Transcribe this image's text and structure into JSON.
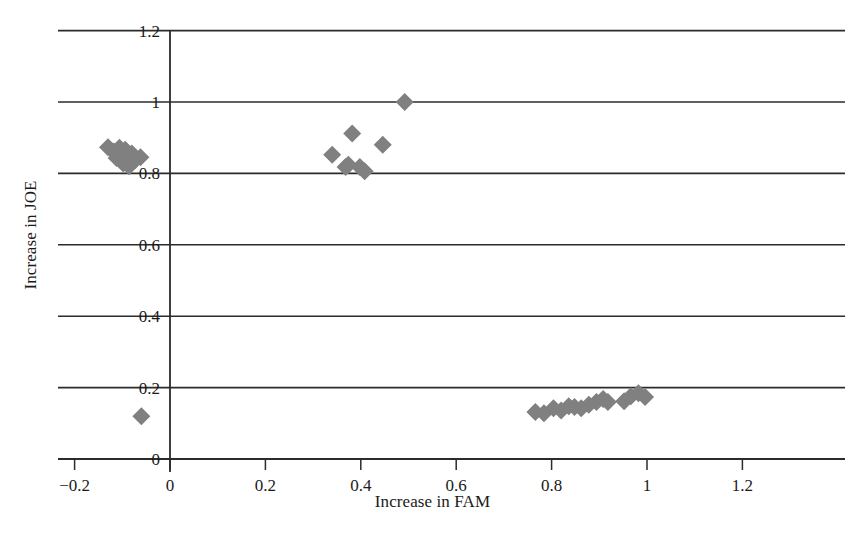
{
  "chart_data": {
    "type": "scatter",
    "title": "",
    "xlabel": "Increase in FAM",
    "ylabel": "Increase in JOE",
    "xlim": [
      -0.2,
      1.2
    ],
    "ylim": [
      0,
      1.2
    ],
    "xticks": [
      -0.2,
      0,
      0.2,
      0.4,
      0.6,
      0.8,
      1,
      1.2
    ],
    "xtick_labels": [
      "−0.2",
      "0",
      "0.2",
      "0.4",
      "0.6",
      "0.8",
      "1",
      "1.2"
    ],
    "yticks": [
      0,
      0.2,
      0.4,
      0.6,
      0.8,
      1,
      1.2
    ],
    "ytick_labels": [
      "0",
      "0.2",
      "0.4",
      "0.6",
      "0.8",
      "1",
      "1.2"
    ],
    "grid": "horizontal",
    "legend": "none",
    "marker": "diamond",
    "marker_color": "#808080",
    "marker_size": 9,
    "series": [
      {
        "name": "samples",
        "points": [
          [
            -0.13,
            0.873
          ],
          [
            -0.118,
            0.861
          ],
          [
            -0.112,
            0.843
          ],
          [
            -0.106,
            0.872
          ],
          [
            -0.1,
            0.852
          ],
          [
            -0.098,
            0.828
          ],
          [
            -0.094,
            0.866
          ],
          [
            -0.09,
            0.84
          ],
          [
            -0.086,
            0.82
          ],
          [
            -0.08,
            0.856
          ],
          [
            -0.074,
            0.836
          ],
          [
            -0.062,
            0.845
          ],
          [
            -0.06,
            0.12
          ],
          [
            0.34,
            0.852
          ],
          [
            0.368,
            0.818
          ],
          [
            0.374,
            0.824
          ],
          [
            0.382,
            0.912
          ],
          [
            0.398,
            0.818
          ],
          [
            0.408,
            0.806
          ],
          [
            0.446,
            0.88
          ],
          [
            0.492,
            1.0
          ],
          [
            0.766,
            0.132
          ],
          [
            0.784,
            0.128
          ],
          [
            0.804,
            0.142
          ],
          [
            0.82,
            0.136
          ],
          [
            0.836,
            0.148
          ],
          [
            0.848,
            0.146
          ],
          [
            0.862,
            0.142
          ],
          [
            0.878,
            0.152
          ],
          [
            0.894,
            0.16
          ],
          [
            0.908,
            0.168
          ],
          [
            0.918,
            0.16
          ],
          [
            0.952,
            0.162
          ],
          [
            0.966,
            0.176
          ],
          [
            0.982,
            0.184
          ],
          [
            0.996,
            0.174
          ]
        ]
      }
    ]
  },
  "axes": {
    "x_title": "Increase in FAM",
    "y_title": "Increase in JOE"
  }
}
